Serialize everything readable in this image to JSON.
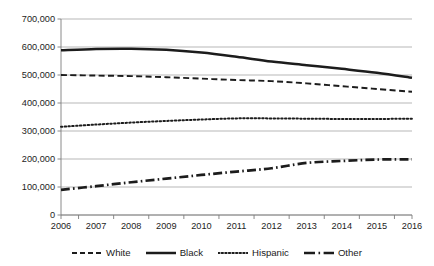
{
  "chart_data": {
    "type": "line",
    "title": "",
    "subtitle": "",
    "xlabel": "",
    "ylabel": "",
    "x": [
      2006,
      2007,
      2008,
      2009,
      2010,
      2011,
      2012,
      2013,
      2014,
      2015,
      2016
    ],
    "categories": [
      "2006",
      "2007",
      "2008",
      "2009",
      "2010",
      "2011",
      "2012",
      "2013",
      "2014",
      "2015",
      "2016"
    ],
    "ylim": [
      0,
      700000
    ],
    "ytick_values": [
      0,
      100000,
      200000,
      300000,
      400000,
      500000,
      600000,
      700000
    ],
    "ytick_labels": [
      "0",
      "100,000",
      "200,000",
      "300,000",
      "400,000",
      "500,000",
      "600,000",
      "700,000"
    ],
    "grid": true,
    "grid_axis": "y",
    "legend_position": "bottom",
    "series": [
      {
        "name": "White",
        "style": "dashed",
        "color": "#1c1c1c",
        "values": [
          500000,
          498000,
          496000,
          492000,
          487000,
          482000,
          478000,
          470000,
          460000,
          450000,
          440000
        ]
      },
      {
        "name": "Black",
        "style": "solid",
        "color": "#1c1c1c",
        "values": [
          588000,
          593000,
          594000,
          590000,
          580000,
          565000,
          548000,
          535000,
          522000,
          508000,
          490000
        ]
      },
      {
        "name": "Hispanic",
        "style": "dotted",
        "color": "#1c1c1c",
        "values": [
          315000,
          323000,
          330000,
          336000,
          341000,
          345000,
          345000,
          344000,
          343000,
          343000,
          344000
        ]
      },
      {
        "name": "Other",
        "style": "dash-dot",
        "color": "#1c1c1c",
        "values": [
          90000,
          103000,
          117000,
          130000,
          143000,
          155000,
          167000,
          186000,
          193000,
          198000,
          199000
        ]
      }
    ]
  },
  "legend": {
    "items": [
      {
        "label": "White",
        "swatch": "dashed-line-swatch"
      },
      {
        "label": "Black",
        "swatch": "solid-line-swatch"
      },
      {
        "label": "Hispanic",
        "swatch": "dotted-line-swatch"
      },
      {
        "label": "Other",
        "swatch": "dash-dot-line-swatch"
      }
    ]
  }
}
